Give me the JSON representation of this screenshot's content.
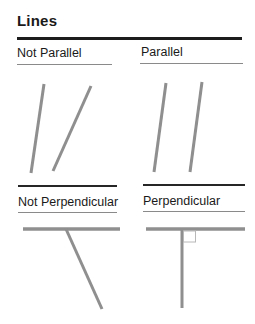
{
  "page": {
    "title": "Lines"
  },
  "colors": {
    "text": "#1a1a1a",
    "rule": "#1d1d1d",
    "divider": "#262626",
    "underline": "#8a8a8a",
    "figure_line": "#8f8f8f",
    "angle_marker": "#b8b8b8",
    "bg": "#ffffff"
  },
  "sections": {
    "top_left": {
      "label": "Not Parallel"
    },
    "top_right": {
      "label": "Parallel"
    },
    "bottom_left": {
      "label": "Not Perpendicular"
    },
    "bottom_right": {
      "label": "Perpendicular"
    }
  },
  "figures": {
    "not_parallel": {
      "lines": [
        {
          "name": "oblique-line-1",
          "x1": 27,
          "y1": 4,
          "x2": 14,
          "y2": 93,
          "w": 3
        },
        {
          "name": "oblique-line-2",
          "x1": 74,
          "y1": 6,
          "x2": 36,
          "y2": 91,
          "w": 3
        }
      ]
    },
    "parallel": {
      "lines": [
        {
          "name": "parallel-line-1",
          "x1": 26,
          "y1": 3,
          "x2": 14,
          "y2": 92,
          "w": 3
        },
        {
          "name": "parallel-line-2",
          "x1": 62,
          "y1": 2,
          "x2": 50,
          "y2": 92,
          "w": 3
        }
      ]
    },
    "not_perpendicular": {
      "lines": [
        {
          "name": "horizontal-line",
          "x1": 6,
          "y1": 7,
          "x2": 103,
          "y2": 7,
          "w": 3.5
        },
        {
          "name": "oblique-line",
          "x1": 49,
          "y1": 7,
          "x2": 85,
          "y2": 87,
          "w": 3
        }
      ]
    },
    "perpendicular": {
      "lines": [
        {
          "name": "horizontal-line",
          "x1": 6,
          "y1": 7,
          "x2": 105,
          "y2": 7,
          "w": 3.5
        },
        {
          "name": "vertical-line",
          "x1": 42,
          "y1": 8,
          "x2": 42,
          "y2": 86,
          "w": 3
        }
      ],
      "rects": [
        {
          "name": "right-angle-marker",
          "x": 43.5,
          "y": 9,
          "w": 12,
          "h": 11
        }
      ]
    }
  }
}
